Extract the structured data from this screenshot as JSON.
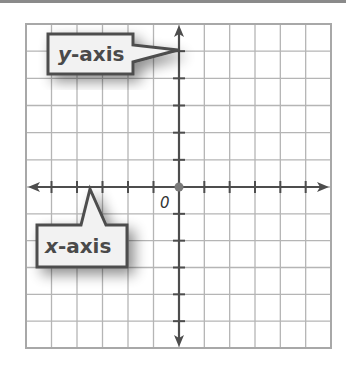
{
  "figure": {
    "type": "coordinate-plane",
    "grid": {
      "columns": 12,
      "rows": 12,
      "left": 26,
      "top": 24,
      "right": 331,
      "bottom": 348,
      "line_color": "#b5b5b5",
      "border_color": "#a8a8a8"
    },
    "origin": {
      "label": "0",
      "x": 179,
      "y": 187,
      "dot_color": "#7a7a7a"
    },
    "axes": {
      "color": "#4d4d4d",
      "x_axis": {
        "callout_var": "x",
        "callout_rest": "-axis",
        "ticks_each_side": 6
      },
      "y_axis": {
        "callout_var": "y",
        "callout_rest": "-axis",
        "ticks_each_side": 6
      }
    },
    "callouts": {
      "fill": "#f2f2f2",
      "stroke": "#4d4d4d",
      "text_color": "#4a4a4a"
    }
  }
}
